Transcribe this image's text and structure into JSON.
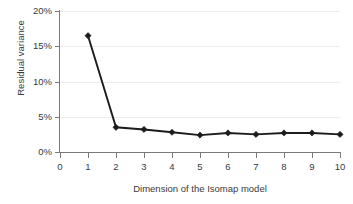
{
  "chart_data": {
    "type": "line",
    "title": "",
    "subtitle": "",
    "xlabel": "Dimension of the Isomap model",
    "ylabel": "Residual variance",
    "x": [
      1,
      2,
      3,
      4,
      5,
      6,
      7,
      8,
      9,
      10
    ],
    "values": [
      16.5,
      3.5,
      3.2,
      2.8,
      2.4,
      2.7,
      2.5,
      2.7,
      2.7,
      2.5
    ],
    "series": [
      {
        "name": "Residual variance",
        "values": [
          16.5,
          3.5,
          3.2,
          2.8,
          2.4,
          2.7,
          2.5,
          2.7,
          2.7,
          2.5
        ]
      }
    ],
    "xlim": [
      0,
      10
    ],
    "ylim": [
      0,
      20
    ],
    "xticks": [
      0,
      1,
      2,
      3,
      4,
      5,
      6,
      7,
      8,
      9,
      10
    ],
    "xtick_labels": [
      "0",
      "1",
      "2",
      "3",
      "4",
      "5",
      "6",
      "7",
      "8",
      "9",
      "10"
    ],
    "yticks": [
      0,
      5,
      10,
      15,
      20
    ],
    "ytick_labels": [
      "0%",
      "5%",
      "10%",
      "15%",
      "20%"
    ],
    "grid": "horizontal",
    "legend": "none",
    "marker": "diamond",
    "line_color": "#1c1c1c",
    "grid_color": "#ededed",
    "axis_color": "#7a7a7a",
    "background_color": "#ffffff",
    "unit": "%"
  }
}
